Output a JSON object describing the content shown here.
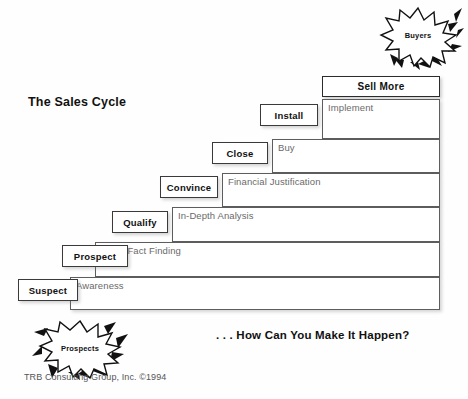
{
  "page": {
    "title": "The Sales Cycle",
    "tagline": ". . . How Can You Make It Happen?",
    "credit": "TRB Consulting Group, Inc. ©1994",
    "background_color": "#fefefe",
    "line_color": "#5d5d5d",
    "label_text_color": "#111111",
    "step_text_color": "#6a6a6a"
  },
  "capstone": {
    "label": "Sell More"
  },
  "bursts": [
    {
      "name": "buyers-burst",
      "label": "Buyers"
    },
    {
      "name": "prospects-burst",
      "label": "Prospects"
    }
  ],
  "steps": [
    {
      "stage": "Suspect",
      "outcome": "Awareness"
    },
    {
      "stage": "Prospect",
      "outcome": "Basic Fact Finding"
    },
    {
      "stage": "Qualify",
      "outcome": "In-Depth Analysis"
    },
    {
      "stage": "Convince",
      "outcome": "Financial Justification"
    },
    {
      "stage": "Close",
      "outcome": "Buy"
    },
    {
      "stage": "Install",
      "outcome": "Implement"
    }
  ]
}
